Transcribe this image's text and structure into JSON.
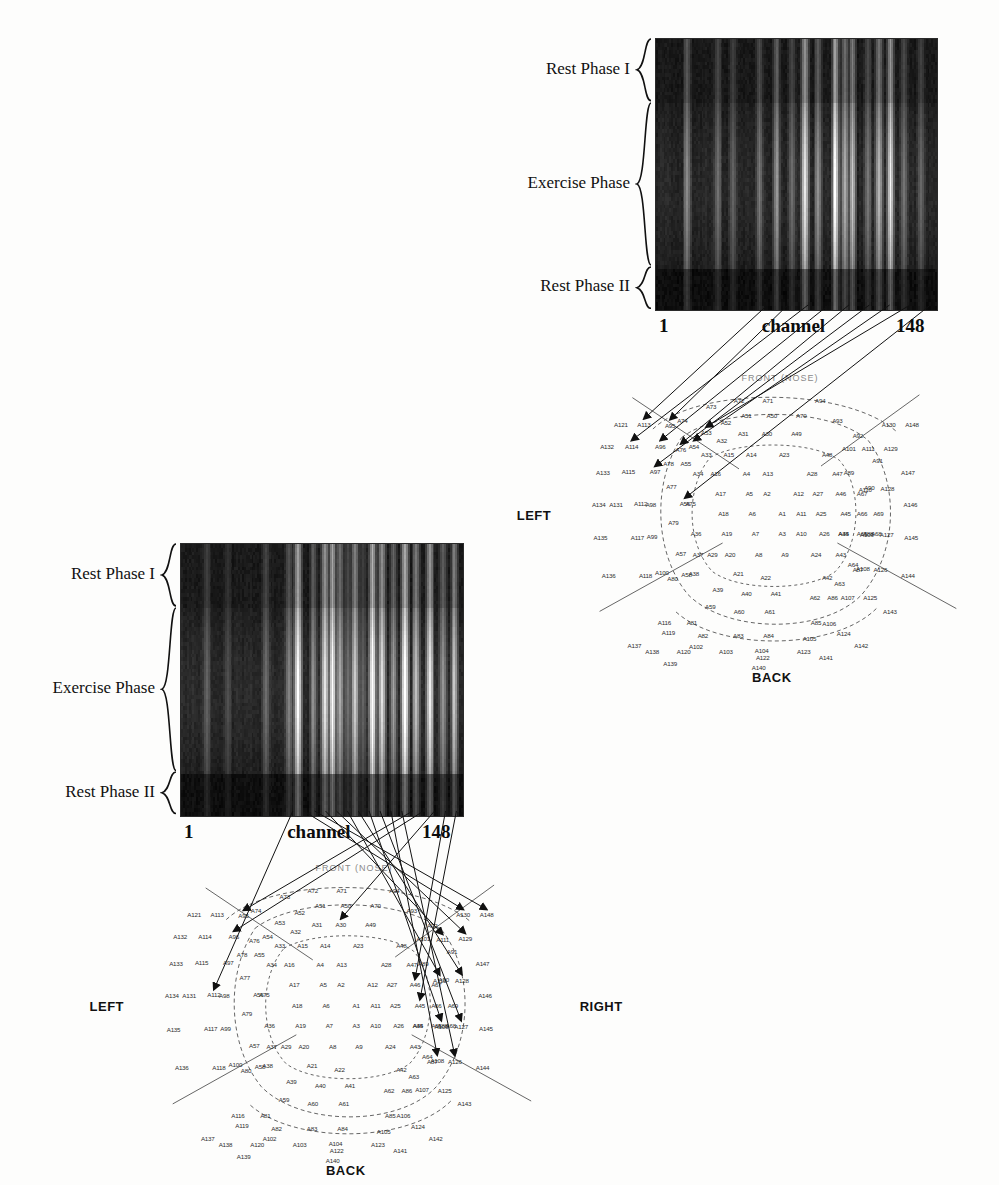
{
  "figure": {
    "background_color": "#fdfdfc",
    "ink_color": "#111111"
  },
  "panels": [
    {
      "id": "upper",
      "heatmap": {
        "x": 655,
        "y": 38,
        "width": 281,
        "height": 271,
        "axis_start_label": "1",
        "axis_end_label": "148",
        "axis_title": "channel",
        "colormap": "grayscale",
        "phases": [
          {
            "label": "Rest Phase I",
            "top_frac": 0.0,
            "height_frac": 0.235
          },
          {
            "label": "Exercise Phase",
            "top_frac": 0.235,
            "height_frac": 0.605
          },
          {
            "label": "Rest Phase II",
            "top_frac": 0.84,
            "height_frac": 0.16
          }
        ]
      },
      "montage": {
        "x": 575,
        "y": 372,
        "width": 410,
        "height": 285,
        "front_label": "FRONT (NOSE)",
        "left_label": "LEFT",
        "right_label": "",
        "back_label": "BACK"
      },
      "arrow_targets": [
        "A113",
        "A95",
        "A114",
        "A96",
        "A76",
        "A97",
        "A54",
        "A53",
        "A56"
      ]
    },
    {
      "id": "lower",
      "heatmap": {
        "x": 180,
        "y": 543,
        "width": 282,
        "height": 272,
        "axis_start_label": "1",
        "axis_end_label": "148",
        "axis_title": "channel",
        "colormap": "grayscale",
        "phases": [
          {
            "label": "Rest Phase I",
            "top_frac": 0.0,
            "height_frac": 0.235
          },
          {
            "label": "Exercise Phase",
            "top_frac": 0.235,
            "height_frac": 0.605
          },
          {
            "label": "Rest Phase II",
            "top_frac": 0.84,
            "height_frac": 0.16
          }
        ]
      },
      "montage": {
        "x": 148,
        "y": 862,
        "width": 412,
        "height": 288,
        "front_label": "FRONT (NOSE)",
        "left_label": "LEFT",
        "right_label": "RIGHT",
        "back_label": "BACK"
      },
      "arrow_targets": [
        "A112",
        "A130",
        "A148",
        "A111",
        "A129",
        "A110",
        "A128",
        "A109",
        "A127",
        "A108",
        "A126",
        "A95",
        "A96",
        "A30",
        "A46",
        "A45"
      ]
    }
  ],
  "chart_data": {
    "type": "heatmap",
    "title": "",
    "xlabel": "channel",
    "ylabel": "",
    "xlim": [
      1,
      148
    ],
    "x_tick_labels": [
      "1",
      "148"
    ],
    "y_tick_labels": [
      "Rest Phase I",
      "Exercise Phase",
      "Rest Phase II"
    ],
    "colormap": "grayscale",
    "legend": "none",
    "grid": false,
    "series": [
      {
        "name": "upper-panel",
        "note": "channel x time power map, mostly low (dark); bright high-power channels listed below",
        "n_channels": 148,
        "bright_channels": [
          {
            "channel": 17,
            "intensity": 0.42
          },
          {
            "channel": 33,
            "intensity": 0.34
          },
          {
            "channel": 41,
            "intensity": 0.3
          },
          {
            "channel": 55,
            "intensity": 0.38
          },
          {
            "channel": 64,
            "intensity": 0.46
          },
          {
            "channel": 72,
            "intensity": 0.33
          },
          {
            "channel": 79,
            "intensity": 0.7
          },
          {
            "channel": 86,
            "intensity": 0.44
          },
          {
            "channel": 95,
            "intensity": 0.78
          },
          {
            "channel": 100,
            "intensity": 0.52
          },
          {
            "channel": 104,
            "intensity": 0.62
          },
          {
            "channel": 112,
            "intensity": 0.36
          },
          {
            "channel": 118,
            "intensity": 0.55
          },
          {
            "channel": 124,
            "intensity": 0.74
          },
          {
            "channel": 131,
            "intensity": 0.35
          },
          {
            "channel": 140,
            "intensity": 0.31
          }
        ],
        "baseline_intensity": 0.1
      },
      {
        "name": "lower-panel",
        "note": "same layout; stronger and wider bright bands in right half",
        "n_channels": 148,
        "bright_channels": [
          {
            "channel": 14,
            "intensity": 0.3
          },
          {
            "channel": 25,
            "intensity": 0.24
          },
          {
            "channel": 45,
            "intensity": 0.33
          },
          {
            "channel": 57,
            "intensity": 0.4
          },
          {
            "channel": 62,
            "intensity": 0.78
          },
          {
            "channel": 70,
            "intensity": 0.44
          },
          {
            "channel": 76,
            "intensity": 0.7
          },
          {
            "channel": 80,
            "intensity": 0.82
          },
          {
            "channel": 84,
            "intensity": 0.52
          },
          {
            "channel": 88,
            "intensity": 0.34
          },
          {
            "channel": 92,
            "intensity": 0.62
          },
          {
            "channel": 96,
            "intensity": 0.3
          },
          {
            "channel": 101,
            "intensity": 0.88
          },
          {
            "channel": 106,
            "intensity": 0.68
          },
          {
            "channel": 112,
            "intensity": 0.5
          },
          {
            "channel": 118,
            "intensity": 0.82
          },
          {
            "channel": 124,
            "intensity": 0.58
          },
          {
            "channel": 131,
            "intensity": 0.72
          },
          {
            "channel": 138,
            "intensity": 0.45
          },
          {
            "channel": 144,
            "intensity": 0.6
          }
        ],
        "baseline_intensity": 0.11
      }
    ]
  },
  "electrodes": [
    {
      "id": "A1",
      "x": 0.505,
      "y": 0.495
    },
    {
      "id": "A2",
      "x": 0.468,
      "y": 0.425
    },
    {
      "id": "A3",
      "x": 0.505,
      "y": 0.565
    },
    {
      "id": "A4",
      "x": 0.418,
      "y": 0.355
    },
    {
      "id": "A5",
      "x": 0.425,
      "y": 0.425
    },
    {
      "id": "A6",
      "x": 0.432,
      "y": 0.495
    },
    {
      "id": "A7",
      "x": 0.44,
      "y": 0.565
    },
    {
      "id": "A8",
      "x": 0.448,
      "y": 0.64
    },
    {
      "id": "A9",
      "x": 0.512,
      "y": 0.64
    },
    {
      "id": "A10",
      "x": 0.552,
      "y": 0.565
    },
    {
      "id": "A11",
      "x": 0.552,
      "y": 0.495
    },
    {
      "id": "A12",
      "x": 0.545,
      "y": 0.425
    },
    {
      "id": "A13",
      "x": 0.47,
      "y": 0.355
    },
    {
      "id": "A14",
      "x": 0.43,
      "y": 0.288
    },
    {
      "id": "A15",
      "x": 0.375,
      "y": 0.288
    },
    {
      "id": "A16",
      "x": 0.343,
      "y": 0.355
    },
    {
      "id": "A17",
      "x": 0.355,
      "y": 0.425
    },
    {
      "id": "A18",
      "x": 0.362,
      "y": 0.495
    },
    {
      "id": "A19",
      "x": 0.37,
      "y": 0.565
    },
    {
      "id": "A20",
      "x": 0.378,
      "y": 0.64
    },
    {
      "id": "A21",
      "x": 0.398,
      "y": 0.705
    },
    {
      "id": "A22",
      "x": 0.465,
      "y": 0.72
    },
    {
      "id": "A23",
      "x": 0.51,
      "y": 0.288
    },
    {
      "id": "A24",
      "x": 0.588,
      "y": 0.64
    },
    {
      "id": "A25",
      "x": 0.6,
      "y": 0.495
    },
    {
      "id": "A26",
      "x": 0.608,
      "y": 0.565
    },
    {
      "id": "A27",
      "x": 0.592,
      "y": 0.425
    },
    {
      "id": "A28",
      "x": 0.578,
      "y": 0.355
    },
    {
      "id": "A29",
      "x": 0.335,
      "y": 0.64
    },
    {
      "id": "A30",
      "x": 0.468,
      "y": 0.215
    },
    {
      "id": "A31",
      "x": 0.41,
      "y": 0.215
    },
    {
      "id": "A32",
      "x": 0.358,
      "y": 0.24
    },
    {
      "id": "A33",
      "x": 0.32,
      "y": 0.288
    },
    {
      "id": "A34",
      "x": 0.3,
      "y": 0.355
    },
    {
      "id": "A35",
      "x": 0.655,
      "y": 0.565
    },
    {
      "id": "A36",
      "x": 0.295,
      "y": 0.565
    },
    {
      "id": "A37",
      "x": 0.3,
      "y": 0.64
    },
    {
      "id": "A38",
      "x": 0.29,
      "y": 0.705
    },
    {
      "id": "A39",
      "x": 0.348,
      "y": 0.76
    },
    {
      "id": "A40",
      "x": 0.418,
      "y": 0.775
    },
    {
      "id": "A41",
      "x": 0.49,
      "y": 0.775
    },
    {
      "id": "A42",
      "x": 0.615,
      "y": 0.72
    },
    {
      "id": "A43",
      "x": 0.648,
      "y": 0.64
    },
    {
      "id": "A44",
      "x": 0.655,
      "y": 0.565
    },
    {
      "id": "A45",
      "x": 0.66,
      "y": 0.495
    },
    {
      "id": "A46",
      "x": 0.648,
      "y": 0.425
    },
    {
      "id": "A47",
      "x": 0.64,
      "y": 0.355
    },
    {
      "id": "A48",
      "x": 0.615,
      "y": 0.288
    },
    {
      "id": "A49",
      "x": 0.54,
      "y": 0.215
    },
    {
      "id": "A50",
      "x": 0.48,
      "y": 0.15
    },
    {
      "id": "A51",
      "x": 0.418,
      "y": 0.15
    },
    {
      "id": "A52",
      "x": 0.368,
      "y": 0.175
    },
    {
      "id": "A53",
      "x": 0.32,
      "y": 0.21
    },
    {
      "id": "A54",
      "x": 0.29,
      "y": 0.258
    },
    {
      "id": "A55",
      "x": 0.27,
      "y": 0.32
    },
    {
      "id": "A56",
      "x": 0.268,
      "y": 0.46
    },
    {
      "id": "A57",
      "x": 0.258,
      "y": 0.635
    },
    {
      "id": "A58",
      "x": 0.272,
      "y": 0.71
    },
    {
      "id": "A59",
      "x": 0.33,
      "y": 0.822
    },
    {
      "id": "A60",
      "x": 0.4,
      "y": 0.838
    },
    {
      "id": "A61",
      "x": 0.475,
      "y": 0.838
    },
    {
      "id": "A62",
      "x": 0.585,
      "y": 0.79
    },
    {
      "id": "A63",
      "x": 0.645,
      "y": 0.742
    },
    {
      "id": "A64",
      "x": 0.678,
      "y": 0.672
    },
    {
      "id": "A65",
      "x": 0.7,
      "y": 0.565
    },
    {
      "id": "A66",
      "x": 0.7,
      "y": 0.495
    },
    {
      "id": "A67",
      "x": 0.7,
      "y": 0.425
    },
    {
      "id": "A68",
      "x": 0.735,
      "y": 0.565
    },
    {
      "id": "A69",
      "x": 0.74,
      "y": 0.495
    },
    {
      "id": "A70",
      "x": 0.552,
      "y": 0.15
    },
    {
      "id": "A71",
      "x": 0.47,
      "y": 0.098
    },
    {
      "id": "A72",
      "x": 0.4,
      "y": 0.098
    },
    {
      "id": "A73",
      "x": 0.332,
      "y": 0.118
    },
    {
      "id": "A74",
      "x": 0.262,
      "y": 0.168
    },
    {
      "id": "A75",
      "x": 0.282,
      "y": 0.46
    },
    {
      "id": "A76",
      "x": 0.258,
      "y": 0.27
    },
    {
      "id": "A77",
      "x": 0.235,
      "y": 0.4
    },
    {
      "id": "A78",
      "x": 0.228,
      "y": 0.32
    },
    {
      "id": "A79",
      "x": 0.24,
      "y": 0.525
    },
    {
      "id": "A80",
      "x": 0.238,
      "y": 0.722
    },
    {
      "id": "A81",
      "x": 0.285,
      "y": 0.878
    },
    {
      "id": "A82",
      "x": 0.312,
      "y": 0.922
    },
    {
      "id": "A83",
      "x": 0.398,
      "y": 0.922
    },
    {
      "id": "A84",
      "x": 0.472,
      "y": 0.922
    },
    {
      "id": "A85",
      "x": 0.588,
      "y": 0.878
    },
    {
      "id": "A86",
      "x": 0.628,
      "y": 0.79
    },
    {
      "id": "A87",
      "x": 0.69,
      "y": 0.69
    },
    {
      "id": "A88",
      "x": 0.715,
      "y": 0.565
    },
    {
      "id": "A89",
      "x": 0.668,
      "y": 0.35
    },
    {
      "id": "A90",
      "x": 0.718,
      "y": 0.405
    },
    {
      "id": "A91",
      "x": 0.738,
      "y": 0.31
    },
    {
      "id": "A92",
      "x": 0.69,
      "y": 0.22
    },
    {
      "id": "A93",
      "x": 0.64,
      "y": 0.168
    },
    {
      "id": "A94",
      "x": 0.598,
      "y": 0.098
    },
    {
      "id": "A95",
      "x": 0.232,
      "y": 0.185
    },
    {
      "id": "A96",
      "x": 0.208,
      "y": 0.258
    },
    {
      "id": "A97",
      "x": 0.195,
      "y": 0.348
    },
    {
      "id": "A98",
      "x": 0.185,
      "y": 0.462
    },
    {
      "id": "A99",
      "x": 0.188,
      "y": 0.575
    },
    {
      "id": "A100",
      "x": 0.212,
      "y": 0.7
    },
    {
      "id": "A101",
      "x": 0.668,
      "y": 0.265
    },
    {
      "id": "A102",
      "x": 0.295,
      "y": 0.96
    },
    {
      "id": "A103",
      "x": 0.368,
      "y": 0.978
    },
    {
      "id": "A104",
      "x": 0.455,
      "y": 0.975
    },
    {
      "id": "A105",
      "x": 0.572,
      "y": 0.935
    },
    {
      "id": "A106",
      "x": 0.62,
      "y": 0.88
    },
    {
      "id": "A107",
      "x": 0.665,
      "y": 0.788
    },
    {
      "id": "A108",
      "x": 0.702,
      "y": 0.688
    },
    {
      "id": "A109",
      "x": 0.712,
      "y": 0.568
    },
    {
      "id": "A110",
      "x": 0.708,
      "y": 0.41
    },
    {
      "id": "A111",
      "x": 0.715,
      "y": 0.268
    },
    {
      "id": "A112",
      "x": 0.16,
      "y": 0.46
    },
    {
      "id": "A113",
      "x": 0.168,
      "y": 0.182
    },
    {
      "id": "A114",
      "x": 0.138,
      "y": 0.258
    },
    {
      "id": "A115",
      "x": 0.13,
      "y": 0.348
    },
    {
      "id": "A116",
      "x": 0.218,
      "y": 0.878
    },
    {
      "id": "A117",
      "x": 0.152,
      "y": 0.578
    },
    {
      "id": "A118",
      "x": 0.172,
      "y": 0.712
    },
    {
      "id": "A119",
      "x": 0.228,
      "y": 0.912
    },
    {
      "id": "A120",
      "x": 0.265,
      "y": 0.98
    },
    {
      "id": "A121",
      "x": 0.112,
      "y": 0.182
    },
    {
      "id": "A122",
      "x": 0.458,
      "y": 1.0
    },
    {
      "id": "A123",
      "x": 0.558,
      "y": 0.978
    },
    {
      "id": "A124",
      "x": 0.655,
      "y": 0.915
    },
    {
      "id": "A125",
      "x": 0.72,
      "y": 0.79
    },
    {
      "id": "A126",
      "x": 0.745,
      "y": 0.69
    },
    {
      "id": "A127",
      "x": 0.76,
      "y": 0.568
    },
    {
      "id": "A128",
      "x": 0.762,
      "y": 0.408
    },
    {
      "id": "A129",
      "x": 0.77,
      "y": 0.265
    },
    {
      "id": "A130",
      "x": 0.765,
      "y": 0.182
    },
    {
      "id": "A131",
      "x": 0.1,
      "y": 0.462
    },
    {
      "id": "A132",
      "x": 0.078,
      "y": 0.258
    },
    {
      "id": "A133",
      "x": 0.068,
      "y": 0.352
    },
    {
      "id": "A134",
      "x": 0.058,
      "y": 0.462
    },
    {
      "id": "A135",
      "x": 0.062,
      "y": 0.58
    },
    {
      "id": "A136",
      "x": 0.082,
      "y": 0.712
    },
    {
      "id": "A137",
      "x": 0.145,
      "y": 0.958
    },
    {
      "id": "A138",
      "x": 0.188,
      "y": 0.98
    },
    {
      "id": "A139",
      "x": 0.232,
      "y": 1.02
    },
    {
      "id": "A140",
      "x": 0.448,
      "y": 1.035
    },
    {
      "id": "A141",
      "x": 0.612,
      "y": 1.0
    },
    {
      "id": "A142",
      "x": 0.698,
      "y": 0.958
    },
    {
      "id": "A143",
      "x": 0.768,
      "y": 0.838
    },
    {
      "id": "A144",
      "x": 0.812,
      "y": 0.712
    },
    {
      "id": "A145",
      "x": 0.82,
      "y": 0.578
    },
    {
      "id": "A146",
      "x": 0.818,
      "y": 0.462
    },
    {
      "id": "A147",
      "x": 0.812,
      "y": 0.352
    },
    {
      "id": "A148",
      "x": 0.822,
      "y": 0.182
    }
  ]
}
